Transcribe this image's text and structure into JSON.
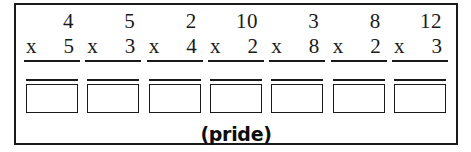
{
  "worksheet": {
    "caption": "(pride)",
    "operator_symbol": "x",
    "border_color": "#1a1a1a",
    "background_color": "#ffffff",
    "problems": [
      {
        "multiplicand": "4",
        "operator": "x",
        "multiplier": "5",
        "answer": ""
      },
      {
        "multiplicand": "5",
        "operator": "x",
        "multiplier": "3",
        "answer": ""
      },
      {
        "multiplicand": "2",
        "operator": "x",
        "multiplier": "4",
        "answer": ""
      },
      {
        "multiplicand": "10",
        "operator": "x",
        "multiplier": "2",
        "answer": ""
      },
      {
        "multiplicand": "3",
        "operator": "x",
        "multiplier": "8",
        "answer": ""
      },
      {
        "multiplicand": "8",
        "operator": "x",
        "multiplier": "2",
        "answer": ""
      },
      {
        "multiplicand": "12",
        "operator": "x",
        "multiplier": "3",
        "answer": ""
      }
    ]
  }
}
